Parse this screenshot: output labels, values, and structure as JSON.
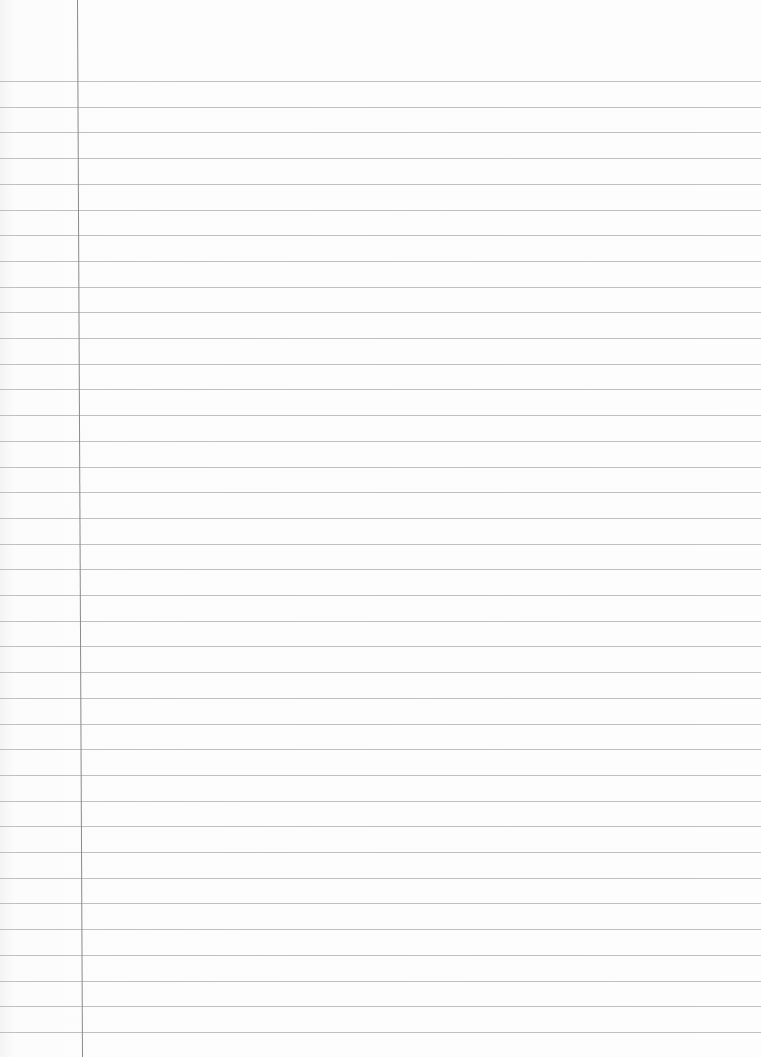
{
  "paper": {
    "type": "lined-paper",
    "background_color": "#fcfcfc",
    "rule_color": "#b9b9b9",
    "margin_color": "#8a8a8a",
    "first_rule_y": 81,
    "last_rule_y": 1032,
    "rule_count": 38,
    "margin_x_top": 77,
    "margin_x_bottom": 82
  }
}
